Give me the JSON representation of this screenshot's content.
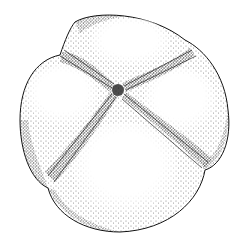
{
  "image": {
    "description": "Black-and-white stippled pen-and-ink illustration of a four-lobed rounded object divided by a cross-shaped furrow",
    "style": "stipple and hatching",
    "colors": {
      "ink": "#111111",
      "paper": "#ffffff"
    },
    "lobes": [
      "top",
      "left",
      "right",
      "bottom"
    ]
  }
}
